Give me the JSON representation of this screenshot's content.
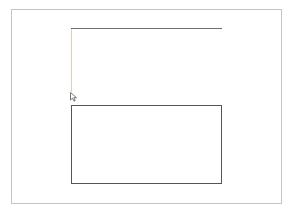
{
  "canvas": {
    "background": "#ffffff",
    "frame_border_color": "#c4c4c8"
  },
  "shapes": [
    {
      "type": "line",
      "name": "top-line",
      "color": "#6e6e6e"
    },
    {
      "type": "line",
      "name": "vertical-guide-line",
      "color": "#f0c8b4"
    },
    {
      "type": "rectangle",
      "name": "drawn-rectangle",
      "color": "#555555"
    }
  ],
  "cursor": {
    "icon": "mouse-pointer-icon"
  }
}
